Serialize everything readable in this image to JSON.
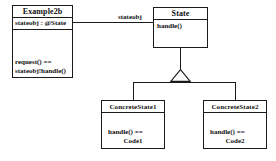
{
  "diagram": {
    "background_color": "#ffffff",
    "line_color": "#1a1a1a",
    "text_color": "#111111"
  },
  "classes": {
    "context": {
      "name": "Example2b",
      "attributes": [
        "stateobj : @State"
      ],
      "operations": [
        "request() ==",
        "stateobj!handle()"
      ]
    },
    "state": {
      "name": "State",
      "attributes": [],
      "operations": [
        "handle()"
      ]
    },
    "concrete1": {
      "name": "ConcreteState1",
      "attributes": [],
      "operations": [
        "handle() ==",
        "Code1"
      ]
    },
    "concrete2": {
      "name": "ConcreteState2",
      "attributes": [],
      "operations": [
        "handle() ==",
        "Code2"
      ]
    }
  },
  "relationships": {
    "association": {
      "label": "stateobj",
      "from": "Example2b",
      "to": "State",
      "kind": "association"
    },
    "generalization": {
      "kind": "generalization",
      "parent": "State",
      "children": [
        "ConcreteState1",
        "ConcreteState2"
      ],
      "arrowhead": "hollow-triangle"
    }
  }
}
